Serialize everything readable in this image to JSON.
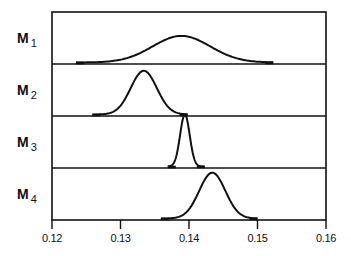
{
  "chart_data": {
    "type": "area",
    "title": "",
    "xlabel": "",
    "ylabel": "",
    "xlim": [
      0.12,
      0.16
    ],
    "xticks": [
      0.12,
      0.13,
      0.14,
      0.15,
      0.16
    ],
    "xtick_labels": [
      "0.12",
      "0.13",
      "0.14",
      "0.15",
      "0.16"
    ],
    "grid": false,
    "legend": "none",
    "layout": "stacked panels (ridgeline), one distribution per row",
    "series": [
      {
        "name": "M1",
        "label_main": "M",
        "label_sub": "1",
        "distribution": "normal",
        "mean": 0.1389,
        "sd": 0.0042,
        "x_range": [
          0.1235,
          0.1523
        ],
        "rel_peak_height": 0.55
      },
      {
        "name": "M2",
        "label_main": "M",
        "label_sub": "2",
        "distribution": "normal",
        "mean": 0.1334,
        "sd": 0.0019,
        "x_range": [
          0.1259,
          0.1398
        ],
        "rel_peak_height": 0.88
      },
      {
        "name": "M3",
        "label_main": "M",
        "label_sub": "3",
        "distribution": "normal",
        "mean": 0.1394,
        "sd": 0.0007,
        "x_range": [
          0.1369,
          0.1423
        ],
        "rel_peak_height": 1.0
      },
      {
        "name": "M4",
        "label_main": "M",
        "label_sub": "4",
        "distribution": "normal",
        "mean": 0.1434,
        "sd": 0.0019,
        "x_range": [
          0.1359,
          0.15
        ],
        "rel_peak_height": 0.92
      }
    ]
  },
  "colors": {
    "line": "#111111",
    "background": "#ffffff"
  }
}
